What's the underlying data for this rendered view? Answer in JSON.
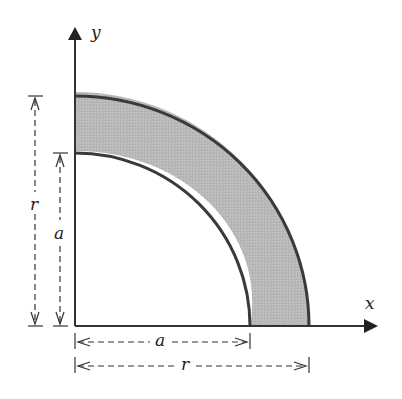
{
  "figure": {
    "type": "quarter-annulus cross-section",
    "axes": {
      "x_label": "x",
      "y_label": "y"
    },
    "inner_radius_label": "a",
    "outer_radius_label": "r",
    "dimensions": {
      "vertical_outer": "r",
      "vertical_inner": "a",
      "horizontal_inner": "a",
      "horizontal_outer": "r"
    },
    "colors": {
      "fill": "#b8b8b8",
      "stroke": "#3a3a3a",
      "background": "#ffffff"
    }
  }
}
